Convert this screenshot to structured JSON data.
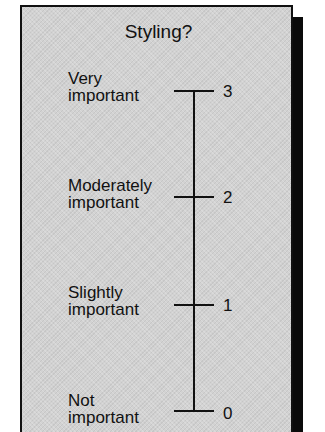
{
  "figure": {
    "title": "Styling?",
    "colors": {
      "panel_background": "#d2d2d2",
      "border": "#111111",
      "shadow": "#0a0a0a",
      "ink": "#111111"
    }
  },
  "scale": {
    "levels": [
      {
        "value": "3",
        "label": "Very\nimportant"
      },
      {
        "value": "2",
        "label": "Moderately\nimportant"
      },
      {
        "value": "1",
        "label": "Slightly\nimportant"
      },
      {
        "value": "0",
        "label": "Not\nimportant"
      }
    ]
  }
}
